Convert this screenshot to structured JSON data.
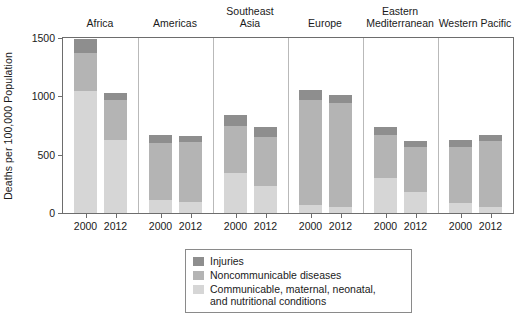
{
  "chart_data": {
    "type": "bar",
    "subtype": "stacked-bar-grouped",
    "title": "",
    "xlabel": "",
    "ylabel": "Deaths per 100,000 Population",
    "ylim": [
      0,
      1500
    ],
    "yticks": [
      0,
      500,
      1000,
      1500
    ],
    "ytick_labels": [
      "0",
      "500",
      "1000",
      "1500"
    ],
    "grid": false,
    "legend_position": "bottom-center",
    "categories": [
      "2000",
      "2012"
    ],
    "groups": [
      {
        "label": "Africa",
        "lines": [
          "Africa"
        ]
      },
      {
        "label": "Americas",
        "lines": [
          "Americas"
        ]
      },
      {
        "label": "Southeast Asia",
        "lines": [
          "Southeast",
          "Asia"
        ]
      },
      {
        "label": "Europe",
        "lines": [
          "Europe"
        ]
      },
      {
        "label": "Eastern Mediterranean",
        "lines": [
          "Eastern",
          "Mediterranean"
        ]
      },
      {
        "label": "Western Pacific",
        "lines": [
          "Western Pacific"
        ]
      }
    ],
    "series": [
      {
        "name": "Communicable, maternal, neonatal, and nutritional conditions",
        "short": "Communicable",
        "color": "#d6d6d6"
      },
      {
        "name": "Noncommunicable diseases",
        "short": "Noncommunicable",
        "color": "#b4b4b4"
      },
      {
        "name": "Injuries",
        "short": "Injuries",
        "color": "#8e8e8e"
      }
    ],
    "bars": [
      {
        "group": "Africa",
        "year": "2000",
        "communicable": 1045,
        "noncommunicable": 325,
        "injuries": 120,
        "total": 1490
      },
      {
        "group": "Africa",
        "year": "2012",
        "communicable": 625,
        "noncommunicable": 345,
        "injuries": 60,
        "total": 1030
      },
      {
        "group": "Americas",
        "year": "2000",
        "communicable": 110,
        "noncommunicable": 490,
        "injuries": 65,
        "total": 665
      },
      {
        "group": "Americas",
        "year": "2012",
        "communicable": 95,
        "noncommunicable": 510,
        "injuries": 55,
        "total": 660
      },
      {
        "group": "Southeast Asia",
        "year": "2000",
        "communicable": 345,
        "noncommunicable": 400,
        "injuries": 95,
        "total": 840
      },
      {
        "group": "Southeast Asia",
        "year": "2012",
        "communicable": 230,
        "noncommunicable": 425,
        "injuries": 85,
        "total": 740
      },
      {
        "group": "Europe",
        "year": "2000",
        "communicable": 65,
        "noncommunicable": 900,
        "injuries": 90,
        "total": 1055
      },
      {
        "group": "Europe",
        "year": "2012",
        "communicable": 55,
        "noncommunicable": 890,
        "injuries": 65,
        "total": 1010
      },
      {
        "group": "Eastern Mediterranean",
        "year": "2000",
        "communicable": 300,
        "noncommunicable": 365,
        "injuries": 70,
        "total": 735
      },
      {
        "group": "Eastern Mediterranean",
        "year": "2012",
        "communicable": 180,
        "noncommunicable": 385,
        "injuries": 55,
        "total": 620
      },
      {
        "group": "Western Pacific",
        "year": "2000",
        "communicable": 85,
        "noncommunicable": 480,
        "injuries": 60,
        "total": 625
      },
      {
        "group": "Western Pacific",
        "year": "2012",
        "communicable": 55,
        "noncommunicable": 560,
        "injuries": 50,
        "total": 665
      }
    ]
  },
  "axes": {
    "y_title": "Deaths per 100,000 Population"
  },
  "legend": {
    "items": [
      {
        "label": "Injuries",
        "color": "#8e8e8e"
      },
      {
        "label": "Noncommunicable diseases",
        "color": "#b4b4b4"
      },
      {
        "label": "Communicable, maternal, neonatal,",
        "color": "#d6d6d6"
      },
      {
        "label": "and nutritional conditions",
        "color": ""
      }
    ]
  },
  "colors": {
    "injuries": "#8e8e8e",
    "noncommunicable": "#b4b4b4",
    "communicable": "#d6d6d6",
    "axis": "#6d6d6d",
    "separator": "#b9b9b9",
    "text": "#1a1a1a"
  }
}
